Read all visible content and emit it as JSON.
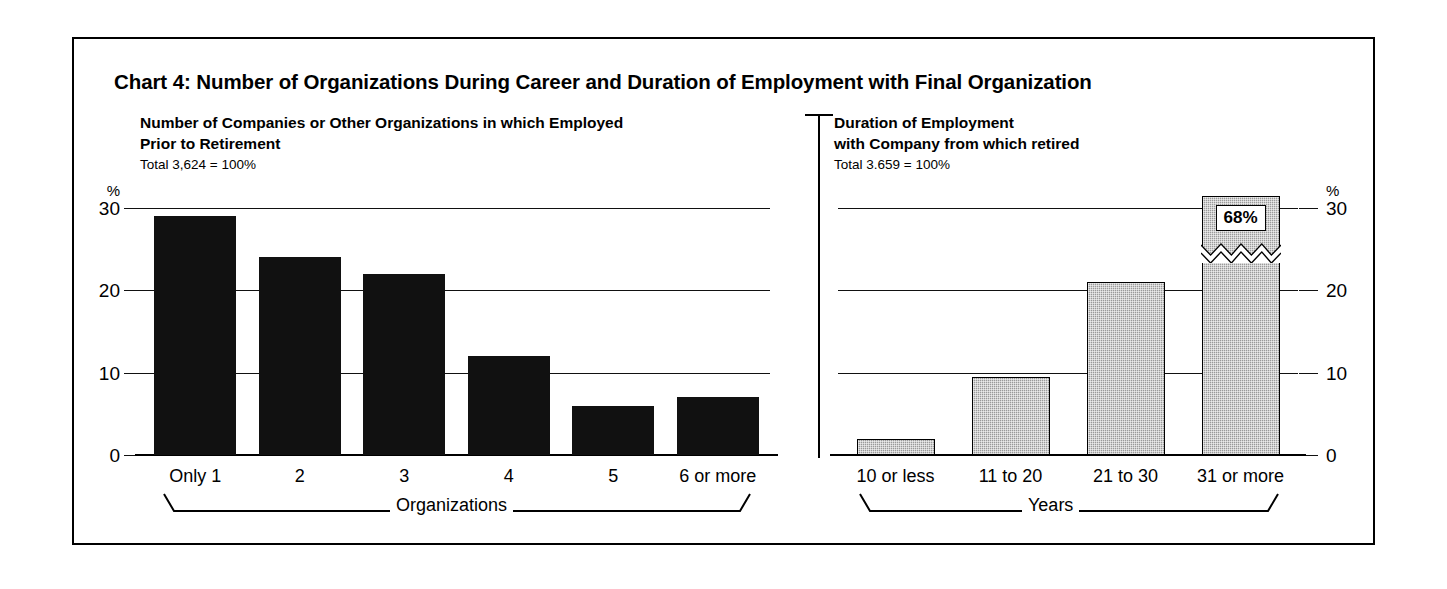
{
  "title": "Chart 4:  Number of Organizations During Career and Duration of Employment with Final Organization",
  "panels": {
    "left": {
      "heading_line1": "Number of Companies or Other Organizations in which Employed",
      "heading_line2": "Prior to Retirement",
      "total": "Total 3,624 = 100%"
    },
    "right": {
      "heading_line1": "Duration of Employment",
      "heading_line2": "with Company from which retired",
      "total": "Total 3.659 = 100%"
    }
  },
  "axis": {
    "percent_symbol": "%",
    "ticks": [
      "30",
      "20",
      "10",
      "0"
    ]
  },
  "brackets": {
    "left_label": "Organizations",
    "right_label": "Years"
  },
  "colors": {
    "bar_left": "#111111",
    "bar_right": "#9a9a9a",
    "frame": "#000000",
    "text": "#000000"
  },
  "chart_data": [
    {
      "type": "bar",
      "title": "Number of Companies or Other Organizations in which Employed Prior to Retirement",
      "subtitle": "Total 3,624 = 100%",
      "xlabel": "Organizations",
      "ylabel": "%",
      "ylim": [
        0,
        30
      ],
      "yticks": [
        0,
        10,
        20,
        30
      ],
      "grid": true,
      "legend": "none",
      "categories": [
        "Only 1",
        "2",
        "3",
        "4",
        "5",
        "6 or more"
      ],
      "values": [
        29,
        24,
        22,
        12,
        6,
        7
      ],
      "bar_style": "solid-black"
    },
    {
      "type": "bar",
      "title": "Duration of Employment with Company from which retired",
      "subtitle": "Total 3.659 = 100%",
      "xlabel": "Years",
      "ylabel": "%",
      "ylim": [
        0,
        30
      ],
      "yticks": [
        0,
        10,
        20,
        30
      ],
      "grid": true,
      "legend": "none",
      "categories": [
        "10  or less",
        "11 to 20",
        "21 to 30",
        "31 or more"
      ],
      "values": [
        2,
        9.5,
        21,
        68
      ],
      "annotations": [
        {
          "category": "31 or more",
          "label": "68%",
          "note": "bar truncated with axis-break zigzag"
        }
      ],
      "bar_style": "gray-stippled"
    }
  ]
}
